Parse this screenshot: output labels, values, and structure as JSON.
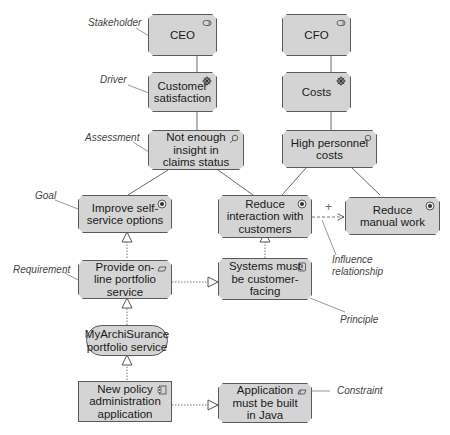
{
  "colors": {
    "node_fill": "#d4d4d4",
    "node_border": "#5a5a5a",
    "line": "#6a6a6a",
    "annotation": "#444444"
  },
  "nodes": {
    "ceo": {
      "label": "CEO",
      "type": "stakeholder",
      "icon": "stakeholder-icon"
    },
    "cfo": {
      "label": "CFO",
      "type": "stakeholder",
      "icon": "stakeholder-icon"
    },
    "customer_satisfaction": {
      "label": "Customer\nsatisfaction",
      "type": "driver",
      "icon": "driver-icon"
    },
    "costs": {
      "label": "Costs",
      "type": "driver",
      "icon": "driver-icon"
    },
    "not_enough_insight": {
      "label": "Not enough\ninsight in\nclaims status",
      "type": "assessment",
      "icon": "assessment-icon"
    },
    "high_personnel_costs": {
      "label": "High personnel\ncosts",
      "type": "assessment",
      "icon": "assessment-icon"
    },
    "improve_self_service": {
      "label": "Improve self-\nservice options",
      "type": "goal",
      "icon": "goal-icon"
    },
    "reduce_interaction": {
      "label": "Reduce\ninteraction with\ncustomers",
      "type": "goal",
      "icon": "goal-icon"
    },
    "reduce_manual_work": {
      "label": "Reduce\nmanual work",
      "type": "goal",
      "icon": "goal-icon"
    },
    "provide_online_portfolio": {
      "label": "Provide on-\nline portfolio\nservice",
      "type": "requirement",
      "icon": "requirement-icon"
    },
    "systems_customer_facing": {
      "label": "Systems must\nbe customer-\nfacing",
      "type": "principle",
      "icon": "principle-icon"
    },
    "myarchisurance_service": {
      "label": "MyArchiSurance\nportfolio service",
      "type": "service"
    },
    "new_policy_app": {
      "label": "New policy\nadministration\napplication",
      "type": "application-component",
      "icon": "component-icon"
    },
    "app_java": {
      "label": "Application\nmust be built\nin Java",
      "type": "constraint",
      "icon": "constraint-icon"
    }
  },
  "annotations": {
    "stakeholder": "Stakeholder",
    "driver": "Driver",
    "assessment": "Assessment",
    "goal": "Goal",
    "requirement": "Requirement",
    "principle": "Principle",
    "constraint": "Constraint",
    "influence": "Influence\nrelationship",
    "influence_sign": "+"
  }
}
